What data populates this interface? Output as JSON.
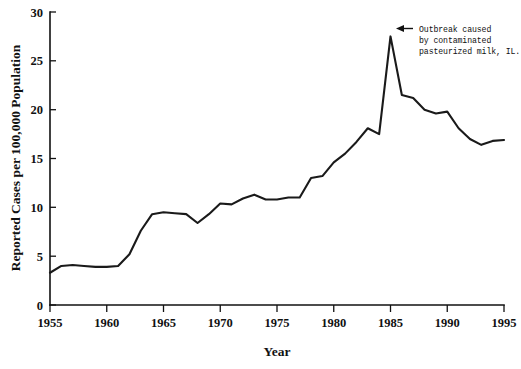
{
  "chart_data": {
    "type": "line",
    "title": "",
    "xlabel": "Year",
    "ylabel": "Reported Cases per 100,000 Population",
    "xlim": [
      1955,
      1995
    ],
    "ylim": [
      0,
      30
    ],
    "xticks": [
      1955,
      1960,
      1965,
      1970,
      1975,
      1980,
      1985,
      1990,
      1995
    ],
    "yticks": [
      0,
      5,
      10,
      15,
      20,
      25,
      30
    ],
    "grid": false,
    "legend": null,
    "line_color": "#1a1a1a",
    "x": [
      1955,
      1956,
      1957,
      1958,
      1959,
      1960,
      1961,
      1962,
      1963,
      1964,
      1965,
      1966,
      1967,
      1968,
      1969,
      1970,
      1971,
      1972,
      1973,
      1974,
      1975,
      1976,
      1977,
      1978,
      1979,
      1980,
      1981,
      1982,
      1983,
      1984,
      1985,
      1986,
      1987,
      1988,
      1989,
      1990,
      1991,
      1992,
      1993,
      1994,
      1995
    ],
    "values": [
      3.3,
      4.0,
      4.1,
      4.0,
      3.9,
      3.9,
      4.0,
      5.2,
      7.6,
      9.3,
      9.5,
      9.4,
      9.3,
      8.4,
      9.3,
      10.4,
      10.3,
      10.9,
      11.3,
      10.8,
      10.8,
      11.0,
      11.0,
      13.0,
      13.2,
      14.6,
      15.5,
      16.7,
      18.1,
      17.5,
      27.5,
      21.5,
      21.2,
      20.0,
      19.6,
      19.8,
      18.1,
      17.0,
      16.4,
      16.8,
      16.9
    ],
    "annotations": [
      {
        "name": "outbreak-annotation",
        "text_lines": [
          "Outbreak caused",
          "by contaminated",
          "pasteurized milk, IL."
        ],
        "points_to_year": 1985,
        "points_to_value": 27.5,
        "arrow": "left-arrow"
      }
    ]
  }
}
